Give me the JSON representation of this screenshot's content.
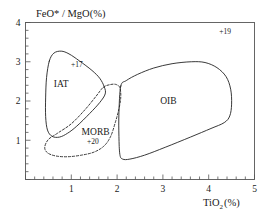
{
  "chart_data": {
    "type": "scatter",
    "title": "",
    "subtitle": "",
    "xlabel": "TiO2 (%)",
    "xlabel_base": "TiO",
    "xlabel_sub": "2",
    "xlabel_unit": "(%)",
    "ylabel": "FeO* / MgO(%)",
    "xlim": [
      0,
      5
    ],
    "ylim": [
      0,
      4
    ],
    "grid": false,
    "legend_position": "none",
    "xticks": [
      0,
      1,
      2,
      3,
      4,
      5
    ],
    "xtick_labels": [
      "",
      "1",
      "2",
      "3",
      "4",
      "5"
    ],
    "xminor_step": 0.2,
    "yticks": [
      0,
      1,
      2,
      3,
      4
    ],
    "ytick_labels": [
      "",
      "1",
      "2",
      "3",
      "4"
    ],
    "yminor_step": 0.2,
    "fields": [
      {
        "name": "IAT",
        "label": "IAT",
        "label_x": 0.78,
        "label_y": 2.45,
        "line_style": "solid",
        "vertices_xy": [
          [
            0.52,
            3.02
          ],
          [
            0.62,
            3.22
          ],
          [
            0.78,
            3.27
          ],
          [
            0.95,
            3.2
          ],
          [
            1.18,
            3.02
          ],
          [
            1.45,
            2.78
          ],
          [
            1.62,
            2.58
          ],
          [
            1.72,
            2.36
          ],
          [
            1.74,
            2.18
          ],
          [
            1.62,
            1.96
          ],
          [
            1.4,
            1.68
          ],
          [
            1.12,
            1.36
          ],
          [
            0.92,
            1.18
          ],
          [
            0.74,
            1.08
          ],
          [
            0.58,
            1.1
          ],
          [
            0.48,
            1.26
          ],
          [
            0.44,
            1.6
          ],
          [
            0.44,
            2.1
          ],
          [
            0.46,
            2.6
          ]
        ]
      },
      {
        "name": "MORB",
        "label": "MORB",
        "label_x": 1.53,
        "label_y": 1.22,
        "line_style": "mixed",
        "vertices_xy": [
          [
            1.7,
            2.35
          ],
          [
            1.86,
            2.42
          ],
          [
            1.98,
            2.42
          ],
          [
            2.06,
            2.34
          ],
          [
            2.08,
            2.1
          ],
          [
            2.04,
            1.8
          ],
          [
            1.96,
            1.45
          ],
          [
            1.86,
            1.1
          ],
          [
            1.72,
            0.86
          ],
          [
            1.5,
            0.7
          ],
          [
            1.22,
            0.62
          ],
          [
            0.92,
            0.58
          ],
          [
            0.66,
            0.6
          ],
          [
            0.48,
            0.68
          ],
          [
            0.42,
            0.82
          ],
          [
            0.5,
            1.02
          ],
          [
            0.7,
            1.18
          ],
          [
            1.0,
            1.42
          ],
          [
            1.3,
            1.78
          ],
          [
            1.54,
            2.12
          ]
        ]
      },
      {
        "name": "OIB",
        "label": "OIB",
        "label_x": 3.12,
        "label_y": 2.0,
        "line_style": "solid",
        "vertices_xy": [
          [
            2.08,
            2.38
          ],
          [
            2.2,
            2.52
          ],
          [
            2.45,
            2.68
          ],
          [
            2.8,
            2.84
          ],
          [
            3.2,
            2.95
          ],
          [
            3.62,
            3.0
          ],
          [
            3.92,
            2.98
          ],
          [
            4.18,
            2.85
          ],
          [
            4.38,
            2.62
          ],
          [
            4.48,
            2.3
          ],
          [
            4.5,
            1.92
          ],
          [
            4.46,
            1.62
          ],
          [
            4.34,
            1.45
          ],
          [
            4.05,
            1.3
          ],
          [
            3.6,
            1.08
          ],
          [
            3.05,
            0.82
          ],
          [
            2.6,
            0.62
          ],
          [
            2.28,
            0.52
          ],
          [
            2.12,
            0.52
          ],
          [
            2.06,
            0.64
          ],
          [
            2.04,
            1.1
          ],
          [
            2.04,
            1.7
          ]
        ]
      }
    ],
    "annotations": [
      {
        "text": "+17",
        "x": 1.12,
        "y": 2.94
      },
      {
        "text": "+20",
        "x": 1.47,
        "y": 0.98
      },
      {
        "text": "+19",
        "x": 4.36,
        "y": 3.78
      }
    ]
  }
}
